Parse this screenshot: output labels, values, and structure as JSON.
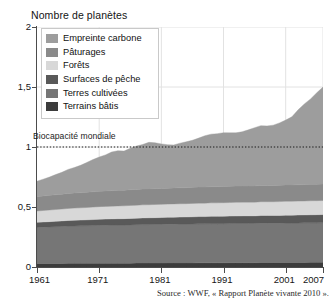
{
  "figure": {
    "y_axis_title": "Nombre de planètes",
    "source_caption": "Source : WWF, « Rapport Planète vivante 2010 »."
  },
  "annotation": {
    "biocapacity_label": "Biocapacité mondiale",
    "biocapacity_value": 1
  },
  "legend": {
    "items": [
      {
        "label": "Empreinte carbone",
        "color": "#9d9d9d"
      },
      {
        "label": "Pâturages",
        "color": "#8a8a8a"
      },
      {
        "label": "Forêts",
        "color": "#d8d8d8"
      },
      {
        "label": "Surfaces de pêche",
        "color": "#595959"
      },
      {
        "label": "Terres cultivées",
        "color": "#767676"
      },
      {
        "label": "Terrains bâtis",
        "color": "#3c3c3c"
      }
    ]
  },
  "axes": {
    "y_ticks": [
      "0",
      "0,5",
      "1",
      "1,5",
      "2"
    ],
    "y_tick_values": [
      0,
      0.5,
      1,
      1.5,
      2
    ],
    "x_ticks": [
      "1961",
      "1971",
      "1981",
      "1991",
      "2001",
      "2007"
    ],
    "x_tick_values": [
      1961,
      1971,
      1981,
      1991,
      2001,
      2007
    ]
  },
  "chart_data": {
    "type": "area",
    "title": "",
    "xlabel": "",
    "ylabel": "Nombre de planètes",
    "xlim": [
      1961,
      2007
    ],
    "ylim": [
      0,
      2
    ],
    "grid": true,
    "legend_position": "top-left",
    "stacked": true,
    "x": [
      1961,
      1962,
      1963,
      1964,
      1965,
      1966,
      1967,
      1968,
      1969,
      1970,
      1971,
      1972,
      1973,
      1974,
      1975,
      1976,
      1977,
      1978,
      1979,
      1980,
      1981,
      1982,
      1983,
      1984,
      1985,
      1986,
      1987,
      1988,
      1989,
      1990,
      1991,
      1992,
      1993,
      1994,
      1995,
      1996,
      1997,
      1998,
      1999,
      2000,
      2001,
      2002,
      2003,
      2004,
      2005,
      2006,
      2007
    ],
    "series": [
      {
        "name": "Terrains bâtis",
        "color": "#3c3c3c",
        "values": [
          0.03,
          0.03,
          0.03,
          0.03,
          0.03,
          0.031,
          0.031,
          0.031,
          0.031,
          0.031,
          0.032,
          0.032,
          0.032,
          0.032,
          0.032,
          0.032,
          0.033,
          0.033,
          0.033,
          0.033,
          0.033,
          0.034,
          0.034,
          0.034,
          0.034,
          0.034,
          0.035,
          0.035,
          0.035,
          0.035,
          0.035,
          0.036,
          0.036,
          0.036,
          0.036,
          0.036,
          0.037,
          0.037,
          0.037,
          0.037,
          0.038,
          0.038,
          0.038,
          0.038,
          0.039,
          0.039,
          0.04
        ]
      },
      {
        "name": "Terres cultivées",
        "color": "#767676",
        "values": [
          0.3,
          0.302,
          0.304,
          0.306,
          0.308,
          0.31,
          0.311,
          0.312,
          0.313,
          0.314,
          0.315,
          0.316,
          0.317,
          0.318,
          0.318,
          0.319,
          0.32,
          0.321,
          0.321,
          0.322,
          0.322,
          0.323,
          0.323,
          0.324,
          0.324,
          0.325,
          0.325,
          0.325,
          0.326,
          0.326,
          0.326,
          0.326,
          0.327,
          0.327,
          0.327,
          0.327,
          0.328,
          0.328,
          0.328,
          0.328,
          0.329,
          0.329,
          0.329,
          0.33,
          0.33,
          0.33,
          0.33
        ]
      },
      {
        "name": "Surfaces de pêche",
        "color": "#595959",
        "values": [
          0.042,
          0.043,
          0.044,
          0.045,
          0.046,
          0.047,
          0.048,
          0.048,
          0.049,
          0.05,
          0.051,
          0.051,
          0.052,
          0.052,
          0.053,
          0.054,
          0.054,
          0.055,
          0.056,
          0.056,
          0.057,
          0.057,
          0.058,
          0.058,
          0.059,
          0.059,
          0.06,
          0.06,
          0.061,
          0.061,
          0.062,
          0.062,
          0.062,
          0.063,
          0.063,
          0.063,
          0.064,
          0.064,
          0.064,
          0.065,
          0.065,
          0.065,
          0.066,
          0.066,
          0.066,
          0.067,
          0.067
        ]
      },
      {
        "name": "Forêts",
        "color": "#d8d8d8",
        "values": [
          0.095,
          0.096,
          0.097,
          0.098,
          0.099,
          0.1,
          0.101,
          0.102,
          0.103,
          0.104,
          0.105,
          0.106,
          0.106,
          0.107,
          0.107,
          0.108,
          0.108,
          0.109,
          0.109,
          0.11,
          0.11,
          0.11,
          0.111,
          0.111,
          0.111,
          0.112,
          0.112,
          0.112,
          0.113,
          0.113,
          0.113,
          0.113,
          0.114,
          0.114,
          0.114,
          0.114,
          0.115,
          0.115,
          0.115,
          0.115,
          0.116,
          0.116,
          0.116,
          0.116,
          0.117,
          0.117,
          0.117
        ]
      },
      {
        "name": "Pâturages",
        "color": "#8a8a8a",
        "values": [
          0.12,
          0.121,
          0.122,
          0.123,
          0.124,
          0.125,
          0.126,
          0.126,
          0.127,
          0.128,
          0.128,
          0.129,
          0.129,
          0.13,
          0.13,
          0.131,
          0.131,
          0.131,
          0.132,
          0.132,
          0.132,
          0.133,
          0.133,
          0.133,
          0.133,
          0.134,
          0.134,
          0.134,
          0.134,
          0.134,
          0.135,
          0.135,
          0.135,
          0.135,
          0.135,
          0.135,
          0.136,
          0.136,
          0.136,
          0.136,
          0.136,
          0.136,
          0.136,
          0.137,
          0.137,
          0.137,
          0.137
        ]
      },
      {
        "name": "Empreinte carbone",
        "color": "#9d9d9d",
        "values": [
          0.128,
          0.14,
          0.152,
          0.168,
          0.182,
          0.2,
          0.212,
          0.228,
          0.248,
          0.268,
          0.285,
          0.3,
          0.322,
          0.33,
          0.326,
          0.345,
          0.362,
          0.372,
          0.388,
          0.382,
          0.372,
          0.362,
          0.358,
          0.372,
          0.382,
          0.392,
          0.408,
          0.428,
          0.438,
          0.442,
          0.448,
          0.446,
          0.444,
          0.452,
          0.468,
          0.486,
          0.498,
          0.496,
          0.502,
          0.52,
          0.54,
          0.568,
          0.625,
          0.672,
          0.712,
          0.762,
          0.808
        ]
      }
    ],
    "totals": [
      0.715,
      0.732,
      0.749,
      0.77,
      0.789,
      0.813,
      0.829,
      0.847,
      0.871,
      0.895,
      0.916,
      0.934,
      0.958,
      0.969,
      0.966,
      0.989,
      1.008,
      1.021,
      1.039,
      1.035,
      1.026,
      1.019,
      1.017,
      1.032,
      1.043,
      1.056,
      1.074,
      1.094,
      1.107,
      1.111,
      1.119,
      1.118,
      1.118,
      1.127,
      1.143,
      1.161,
      1.178,
      1.176,
      1.182,
      1.201,
      1.224,
      1.252,
      1.31,
      1.359,
      1.401,
      1.452,
      1.499
    ],
    "annotations": [
      {
        "text": "Biocapacité mondiale",
        "y": 1,
        "style": "dotted-line"
      }
    ]
  }
}
